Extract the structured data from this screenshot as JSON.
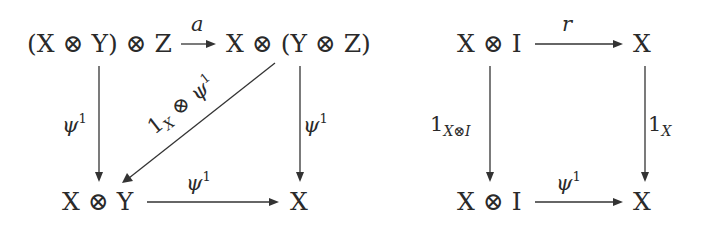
{
  "diagrams": [
    {
      "name": "associativity-square",
      "nodes": {
        "top_left": "(X ⊗ Y) ⊗ Z",
        "top_right": "X ⊗ (Y ⊗ Z)",
        "bottom_left": "X ⊗ Y",
        "bottom_right": "X"
      },
      "arrows": {
        "top": {
          "label": "a",
          "from": "top_left",
          "to": "top_right"
        },
        "left": {
          "label_base": "ψ",
          "label_sup": "1",
          "from": "top_left",
          "to": "bottom_left"
        },
        "right": {
          "label_base": "ψ",
          "label_sup": "1",
          "from": "top_right",
          "to": "bottom_right"
        },
        "bottom": {
          "label_base": "ψ",
          "label_sup": "1",
          "from": "bottom_left",
          "to": "bottom_right"
        },
        "diagonal": {
          "label_base": "1",
          "label_sub": "X",
          "label_op": " ⊗ ",
          "label_psi": "ψ",
          "label_sup": "1",
          "from": "top_right",
          "to": "bottom_left"
        }
      }
    },
    {
      "name": "unit-square",
      "nodes": {
        "top_left": "X ⊗ I",
        "top_right": "X",
        "bottom_left": "X ⊗ I",
        "bottom_right": "X"
      },
      "arrows": {
        "top": {
          "label": "r",
          "from": "top_left",
          "to": "top_right"
        },
        "left": {
          "label_base": "1",
          "label_sub": "X⊗I",
          "from": "top_left",
          "to": "bottom_left"
        },
        "right": {
          "label_base": "1",
          "label_sub": "X",
          "from": "top_right",
          "to": "bottom_right"
        },
        "bottom": {
          "label_base": "ψ",
          "label_sup": "1",
          "from": "bottom_left",
          "to": "bottom_right"
        }
      }
    }
  ],
  "colors": {
    "ink": "#333333",
    "background": "#ffffff"
  }
}
